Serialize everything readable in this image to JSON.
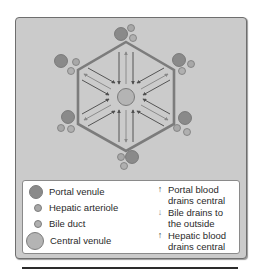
{
  "colors": {
    "panel_bg": "#cbcbcb",
    "hexagon_stroke": "#7a7a7a",
    "portal_venule": "#8a8a8a",
    "hepatic_arteriole": "#a8a8a8",
    "bile_duct": "#b0b0b0",
    "central_venule": "#b4b4b4",
    "arrow_dark": "#555555",
    "arrow_light": "#8c8c8c"
  },
  "diagram": {
    "type": "hepatic-lobule",
    "shape": "hexagon",
    "center_structure": "central venule",
    "vertex_structures": "portal triads (portal venule, hepatic arteriole, bile duct)",
    "flows": [
      {
        "direction": "inward",
        "meaning": "Portal blood drains central"
      },
      {
        "direction": "outward",
        "meaning": "Bile drains to the outside"
      },
      {
        "direction": "inward",
        "meaning": "Hepatic blood drains central"
      }
    ]
  },
  "legend": {
    "structures": [
      {
        "icon": "portal-venule-dot",
        "label": "Portal venule"
      },
      {
        "icon": "hepatic-arteriole-dot",
        "label": "Hepatic arteriole"
      },
      {
        "icon": "bile-duct-dot",
        "label": "Bile duct"
      },
      {
        "icon": "central-venule-dot",
        "label": "Central venule"
      }
    ],
    "flows": [
      {
        "icon": "arrow-up-icon",
        "glyph": "↑",
        "line1": "Portal blood",
        "line2": "drains central"
      },
      {
        "icon": "arrow-down-icon",
        "glyph": "↓",
        "line1": "Bile drains to",
        "line2": "the outside"
      },
      {
        "icon": "arrow-up-icon",
        "glyph": "↑",
        "line1": "Hepatic blood",
        "line2": "drains central"
      }
    ]
  }
}
